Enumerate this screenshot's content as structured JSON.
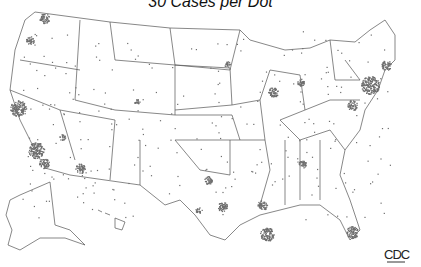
{
  "title": "30 Cases per Dot",
  "logo": "CDC",
  "map": {
    "region": "United States",
    "dot_value": 30,
    "dot_color": "#6e6e6e",
    "border_color": "#555555"
  },
  "clusters": [
    {
      "name": "Seattle",
      "x": 44,
      "y": 18,
      "r": 5
    },
    {
      "name": "Portland",
      "x": 30,
      "y": 40,
      "r": 4
    },
    {
      "name": "San Francisco Bay",
      "x": 18,
      "y": 108,
      "r": 8
    },
    {
      "name": "Los Angeles",
      "x": 36,
      "y": 150,
      "r": 8
    },
    {
      "name": "San Diego",
      "x": 44,
      "y": 163,
      "r": 5
    },
    {
      "name": "Las Vegas",
      "x": 62,
      "y": 137,
      "r": 3
    },
    {
      "name": "Phoenix",
      "x": 80,
      "y": 168,
      "r": 5
    },
    {
      "name": "Denver",
      "x": 137,
      "y": 102,
      "r": 3
    },
    {
      "name": "Dallas",
      "x": 208,
      "y": 180,
      "r": 4
    },
    {
      "name": "Houston",
      "x": 222,
      "y": 206,
      "r": 5
    },
    {
      "name": "San Antonio",
      "x": 198,
      "y": 210,
      "r": 3
    },
    {
      "name": "New Orleans",
      "x": 262,
      "y": 205,
      "r": 5
    },
    {
      "name": "Atlanta",
      "x": 302,
      "y": 164,
      "r": 4
    },
    {
      "name": "Miami",
      "x": 352,
      "y": 232,
      "r": 6
    },
    {
      "name": "Chicago",
      "x": 273,
      "y": 92,
      "r": 5
    },
    {
      "name": "Detroit",
      "x": 300,
      "y": 82,
      "r": 4
    },
    {
      "name": "Minneapolis",
      "x": 227,
      "y": 64,
      "r": 3
    },
    {
      "name": "New York",
      "x": 370,
      "y": 85,
      "r": 9
    },
    {
      "name": "Boston",
      "x": 386,
      "y": 65,
      "r": 5
    },
    {
      "name": "Washington",
      "x": 352,
      "y": 105,
      "r": 5
    },
    {
      "name": "Puerto Rico",
      "x": 267,
      "y": 234,
      "r": 7
    }
  ]
}
